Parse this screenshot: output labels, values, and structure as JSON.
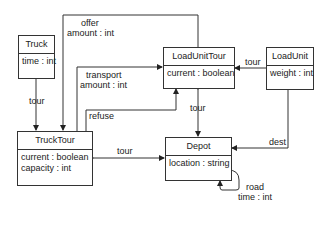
{
  "diagram": {
    "classes": [
      {
        "id": "truck",
        "name": "Truck",
        "attributes": [
          "time : int"
        ]
      },
      {
        "id": "trucktour",
        "name": "TruckTour",
        "attributes": [
          "current : boolean",
          "capacity : int"
        ]
      },
      {
        "id": "loadunittour",
        "name": "LoadUnitTour",
        "attributes": [
          "current : boolean"
        ]
      },
      {
        "id": "loadunit",
        "name": "LoadUnit",
        "attributes": [
          "weight : int"
        ]
      },
      {
        "id": "depot",
        "name": "Depot",
        "attributes": [
          "location : string"
        ]
      }
    ],
    "associations": [
      {
        "from": "Truck",
        "to": "TruckTour",
        "label": "tour"
      },
      {
        "from": "LoadUnitTour",
        "to": "TruckTour",
        "label": "offer",
        "attribute": "amount : int"
      },
      {
        "from": "TruckTour",
        "to": "LoadUnitTour",
        "label": "transport",
        "attribute": "amount : int"
      },
      {
        "from": "TruckTour",
        "to": "LoadUnitTour",
        "label": "refuse"
      },
      {
        "from": "LoadUnit",
        "to": "LoadUnitTour",
        "label": "tour"
      },
      {
        "from": "LoadUnitTour",
        "to": "Depot",
        "label": "tour"
      },
      {
        "from": "Depot",
        "to": "TruckTour",
        "label": "tour"
      },
      {
        "from": "LoadUnit",
        "to": "Depot",
        "label": "dest"
      },
      {
        "from": "Depot",
        "to": "Depot",
        "label": "road",
        "attribute": "time : int"
      }
    ]
  }
}
